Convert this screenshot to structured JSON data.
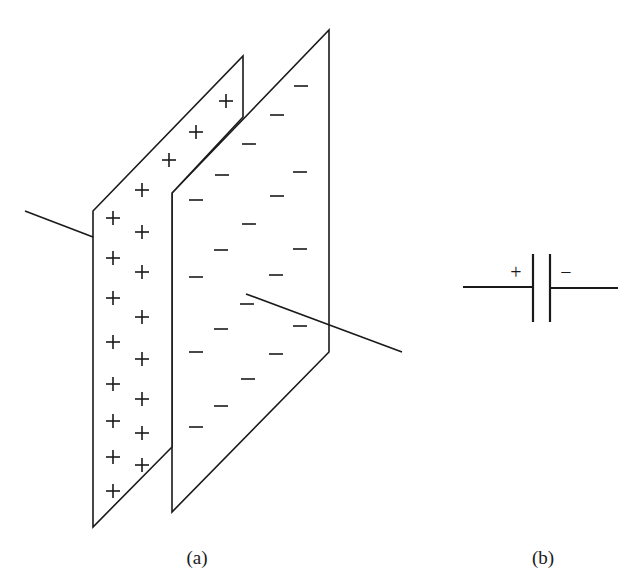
{
  "figure": {
    "panels": [
      {
        "id": "a",
        "label": "(a)",
        "description": "Parallel-plate capacitor in perspective with charged plates"
      },
      {
        "id": "b",
        "label": "(b)",
        "description": "Capacitor circuit symbol"
      }
    ],
    "panel_a": {
      "positive_plate": {
        "charge_symbol": "+",
        "outline": [
          [
            93,
            211
          ],
          [
            243,
            56
          ],
          [
            243,
            117
          ],
          [
            172,
            193
          ],
          [
            172,
            447
          ],
          [
            93,
            527
          ]
        ],
        "charges": [
          [
            226,
            101
          ],
          [
            196,
            132
          ],
          [
            169,
            160
          ],
          [
            142,
            190
          ],
          [
            142,
            232
          ],
          [
            142,
            272
          ],
          [
            142,
            317
          ],
          [
            142,
            359
          ],
          [
            142,
            399
          ],
          [
            142,
            433
          ],
          [
            142,
            465
          ],
          [
            113,
            218
          ],
          [
            113,
            258
          ],
          [
            113,
            298
          ],
          [
            113,
            342
          ],
          [
            113,
            384
          ],
          [
            113,
            421
          ],
          [
            113,
            457
          ],
          [
            113,
            491
          ]
        ]
      },
      "negative_plate": {
        "charge_symbol": "−",
        "outline": [
          [
            172,
            193
          ],
          [
            329,
            30
          ],
          [
            329,
            352
          ],
          [
            172,
            512
          ]
        ],
        "charges": [
          [
            301,
            86
          ],
          [
            277,
            115
          ],
          [
            249,
            144
          ],
          [
            222,
            175
          ],
          [
            196,
            200
          ],
          [
            300,
            172
          ],
          [
            277,
            196
          ],
          [
            249,
            224
          ],
          [
            221,
            250
          ],
          [
            196,
            277
          ],
          [
            300,
            249
          ],
          [
            276,
            275
          ],
          [
            247,
            304
          ],
          [
            221,
            329
          ],
          [
            196,
            352
          ],
          [
            300,
            326
          ],
          [
            276,
            354
          ],
          [
            248,
            379
          ],
          [
            221,
            406
          ],
          [
            196,
            427
          ]
        ]
      },
      "lead_left": [
        [
          25,
          211
        ],
        [
          93,
          237
        ]
      ],
      "lead_right": [
        [
          246,
          294
        ],
        [
          402,
          352
        ]
      ]
    },
    "panel_b": {
      "plus_label": "+",
      "minus_label": "−"
    }
  }
}
